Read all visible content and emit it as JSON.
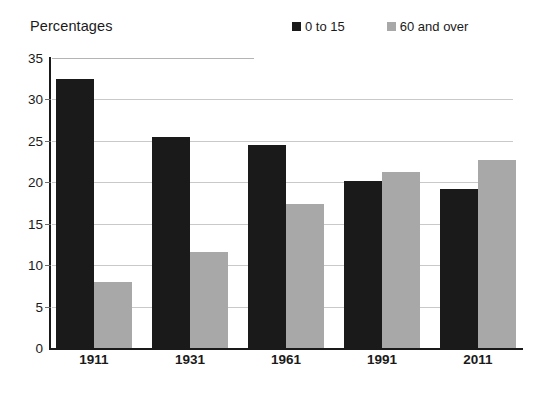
{
  "chart_data": {
    "type": "bar",
    "title": "",
    "ylabel": "Percentages",
    "xlabel": "",
    "categories": [
      "1911",
      "1931",
      "1961",
      "1991",
      "2011"
    ],
    "series": [
      {
        "name": "0 to 15",
        "color": "#1a1a1a",
        "values": [
          32.5,
          25.5,
          24.5,
          20.2,
          19.2
        ]
      },
      {
        "name": "60 and over",
        "color": "#a8a8a8",
        "values": [
          8.0,
          11.6,
          17.4,
          21.2,
          22.7
        ]
      }
    ],
    "ylim": [
      0,
      35
    ],
    "yticks": [
      0,
      5,
      10,
      15,
      20,
      25,
      30,
      35
    ],
    "ytick_labels": [
      "0",
      "5",
      "10",
      "15",
      "20",
      "25",
      "30",
      "35"
    ],
    "grid": true,
    "legend_position": "top-right",
    "background": "#ffffff",
    "axis_color": "#1a1a1a",
    "grid_color": "#c9c9c9"
  }
}
